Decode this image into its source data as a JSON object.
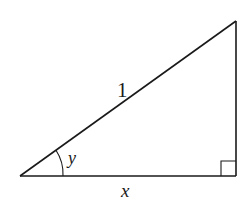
{
  "diagram": {
    "type": "right-triangle",
    "vertices": {
      "left": [
        20,
        176
      ],
      "top_right": [
        236,
        21
      ],
      "bottom_right": [
        236,
        176
      ]
    },
    "labels": {
      "hypotenuse": "1",
      "angle": "y",
      "base": "x"
    },
    "right_angle_marker": true,
    "stroke_color": "#1a1a1a"
  }
}
